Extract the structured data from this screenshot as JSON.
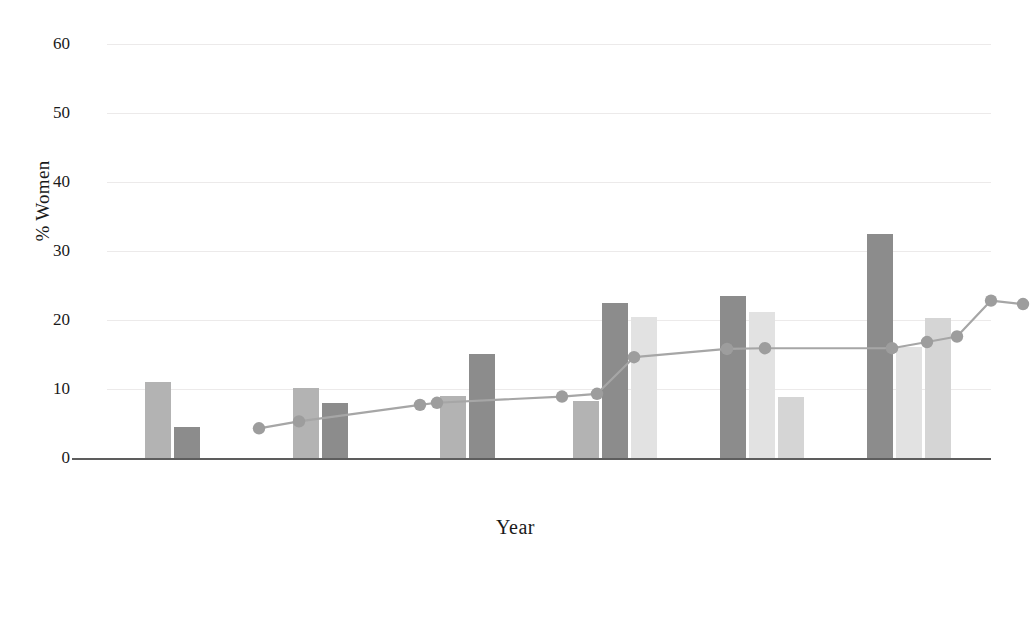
{
  "chart_data": {
    "type": "bar",
    "title": "",
    "xlabel": "Year",
    "ylabel": "% Women",
    "categories": [
      "1995",
      "2000",
      "2005",
      "2010",
      "2015",
      "2018"
    ],
    "ylim": [
      0,
      62
    ],
    "yticks": [
      0,
      10,
      20,
      30,
      40,
      50,
      60
    ],
    "grid": true,
    "legend_position": "bottom",
    "series": [
      {
        "name": "VIS",
        "color": "#b3b3b3",
        "values": [
          11.0,
          10.1,
          9.0,
          8.2,
          null,
          null
        ]
      },
      {
        "name": "InfoVis",
        "color": "#8c8c8c",
        "values": [
          4.5,
          7.9,
          15.1,
          22.5,
          23.5,
          32.5
        ]
      },
      {
        "name": "VAST",
        "color": "#e2e2e2",
        "values": [
          null,
          null,
          null,
          20.4,
          21.2,
          16.1
        ]
      },
      {
        "name": "SciVis",
        "color": "#d5d5d5",
        "values": [
          null,
          null,
          null,
          null,
          8.9,
          20.3
        ]
      }
    ],
    "overlay_line": {
      "name": "VIS trend",
      "color": "#a6a6a6",
      "marker_color": "#9d9d9d",
      "points": [
        {
          "x": 152,
          "y": 4.3
        },
        {
          "x": 192,
          "y": 5.3
        },
        {
          "x": 313,
          "y": 7.7
        },
        {
          "x": 330,
          "y": 8.0
        },
        {
          "x": 455,
          "y": 8.9
        },
        {
          "x": 490,
          "y": 9.3
        },
        {
          "x": 527,
          "y": 14.6
        },
        {
          "x": 620,
          "y": 15.8
        },
        {
          "x": 658,
          "y": 15.9
        },
        {
          "x": 785,
          "y": 15.9
        },
        {
          "x": 820,
          "y": 16.8
        },
        {
          "x": 850,
          "y": 17.6
        },
        {
          "x": 884,
          "y": 22.8
        },
        {
          "x": 916,
          "y": 22.3
        }
      ]
    }
  },
  "legend": {
    "items": [
      {
        "label": "VIS",
        "color": "#b3b3b3"
      },
      {
        "label": "InfoVis",
        "color": "#8c8c8c"
      },
      {
        "label": "VAST",
        "color": "#e2e2e2"
      },
      {
        "label": "SciVis",
        "color": "#d5d5d5"
      }
    ]
  }
}
